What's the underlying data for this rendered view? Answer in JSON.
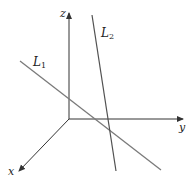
{
  "diagram": {
    "type": "3d-coordinate-axes-with-lines",
    "axes": {
      "x": {
        "label": "x"
      },
      "y": {
        "label": "y"
      },
      "z": {
        "label": "z"
      }
    },
    "lines": [
      {
        "label": "L",
        "subscript": "1",
        "color": "#7a7a7a"
      },
      {
        "label": "L",
        "subscript": "2",
        "color": "#505050"
      }
    ],
    "colors": {
      "axis": "#333333",
      "background": "#ffffff"
    }
  }
}
